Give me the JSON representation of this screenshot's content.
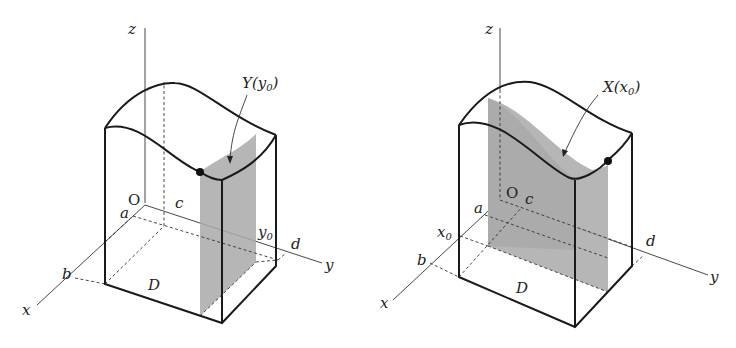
{
  "figures": [
    {
      "id": "left",
      "axes": {
        "x": "x",
        "y": "y",
        "z": "z"
      },
      "origin_label": "O",
      "bounds": {
        "a": "a",
        "b": "b",
        "c": "c",
        "d": "d"
      },
      "slice_value": "y",
      "slice_value_sub": "0",
      "region_label": "D",
      "section_label": "Y(y",
      "section_label_sub": "0",
      "section_label_close": ")"
    },
    {
      "id": "right",
      "axes": {
        "x": "x",
        "y": "y",
        "z": "z"
      },
      "origin_label": "O",
      "bounds": {
        "a": "a",
        "b": "b",
        "c": "c",
        "d": "d"
      },
      "slice_value": "x",
      "slice_value_sub": "0",
      "region_label": "D",
      "section_label": "X(x",
      "section_label_sub": "0",
      "section_label_close": ")"
    }
  ],
  "colors": {
    "shade": "#a9a9a9",
    "line": "#1a1a1a"
  }
}
